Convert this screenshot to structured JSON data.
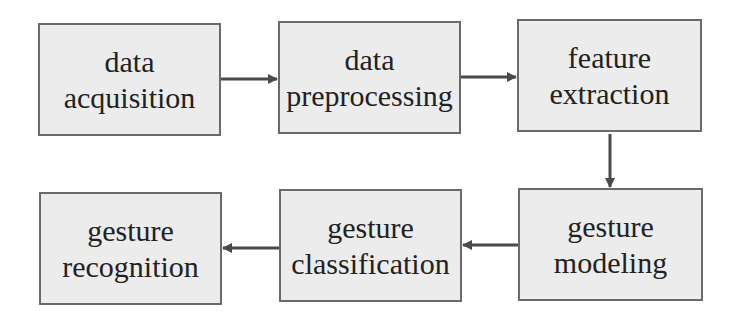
{
  "diagram": {
    "type": "flowchart",
    "colors": {
      "box_fill": "#ececec",
      "box_border": "#6a6a6a",
      "arrow": "#4a4a4a",
      "text": "#222222"
    },
    "nodes": [
      {
        "id": "acq",
        "line1": "data",
        "line2": "acquisition"
      },
      {
        "id": "pre",
        "line1": "data",
        "line2": "preprocessing"
      },
      {
        "id": "feat",
        "line1": "feature",
        "line2": "extraction"
      },
      {
        "id": "model",
        "line1": "gesture",
        "line2": "modeling"
      },
      {
        "id": "class",
        "line1": "gesture",
        "line2": "classification"
      },
      {
        "id": "recog",
        "line1": "gesture",
        "line2": "recognition"
      }
    ],
    "edges": [
      {
        "from": "acq",
        "to": "pre"
      },
      {
        "from": "pre",
        "to": "feat"
      },
      {
        "from": "feat",
        "to": "model"
      },
      {
        "from": "model",
        "to": "class"
      },
      {
        "from": "class",
        "to": "recog"
      }
    ]
  }
}
